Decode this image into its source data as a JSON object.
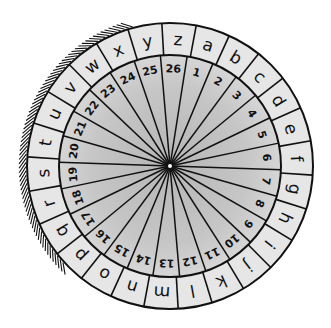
{
  "illustration": {
    "title": "Cipher wheel",
    "outer_ring": {
      "letters": [
        "a",
        "b",
        "c",
        "d",
        "e",
        "f",
        "g",
        "h",
        "i",
        "j",
        "k",
        "l",
        "m",
        "n",
        "o",
        "p",
        "q",
        "r",
        "s",
        "t",
        "u",
        "v",
        "w",
        "x",
        "y",
        "z"
      ],
      "start_angle_deg": 17.5,
      "fill": "#e6e6e6"
    },
    "inner_ring": {
      "numbers": [
        "1",
        "2",
        "3",
        "4",
        "5",
        "6",
        "7",
        "8",
        "9",
        "10",
        "11",
        "12",
        "13",
        "14",
        "15",
        "16",
        "17",
        "18",
        "19",
        "20",
        "21",
        "22",
        "23",
        "24",
        "25",
        "26"
      ],
      "start_angle_deg": 15.8
    },
    "geometry": {
      "center_x": 170,
      "center_y": 166,
      "outer_radius": 143,
      "letter_ring_inner_radius": 111,
      "number_text_radius": 97
    },
    "colors": {
      "stroke": "#111111",
      "outer_fill": "#e6e6e6",
      "inner_fill_edge": "#d2d2d2",
      "inner_fill_center": "#b8b8b8",
      "center_pin": "#ffffff"
    },
    "hatching": {
      "start_deg": 228,
      "end_deg": 345,
      "count": 70
    }
  }
}
